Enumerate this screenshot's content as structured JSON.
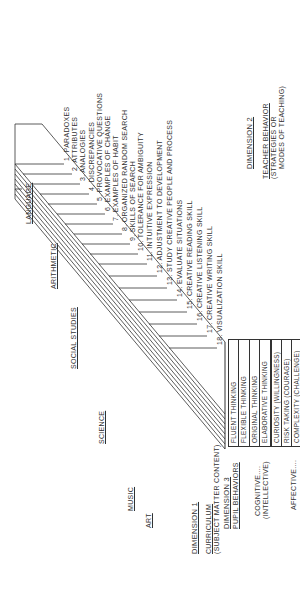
{
  "dimension1": {
    "title": "DIMENSION 1",
    "subtitle_line1": "CURRICULUM",
    "subtitle_line2": "(SUBJECT MATTER CONTENT)",
    "subjects": [
      "ART",
      "MUSIC",
      "SCIENCE",
      "SOCIAL STUDIES",
      "ARITHMETIC",
      "LANGUAGE"
    ]
  },
  "dimension2": {
    "title": "DIMENSION 2",
    "subtitle_line1": "TEACHER BEHAVIOR",
    "subtitle_line2": "(STRATEGIES OR",
    "subtitle_line3": "MODES OF TEACHING)",
    "strategies": [
      "1. PARADOXES",
      "2. ATTRIBUTES",
      "3. ANALOGIES",
      "4. DISCREPANCIES",
      "5. PROVOCATIVE QUESTIONS",
      "6. EXAMPLES OF CHANGE",
      "7. EXAMPLES OF HABIT",
      "8. ORGANIZED RANDOM SEARCH",
      "9. SKILLS OF SEARCH",
      "10. TOLERANCE FOR AMBIGUITY",
      "11. INTUITIVE EXPRESSION",
      "12. ADJUSTMENT TO DEVELOPMENT",
      "13. STUDY CREATIVE PEOPLE AND PROCESS",
      "14. EVALUATE SITUATIONS",
      "15. CREATIVE READING SKILL",
      "16. CREATIVE LISTENING SKILL",
      "17. CREATIVE WRITING SKILL",
      "18. VISUALIZATION SKILL"
    ]
  },
  "dimension3": {
    "title": "DIMENSION 3",
    "subtitle": "PUPIL BEHAVIORS",
    "cognitive_label": "COGNITIVE....",
    "cognitive_sub": "(INTELLECTIVE)",
    "affective_label": "AFFECTIVE....",
    "affective_sub": "(FEELING)",
    "cognitive_behaviors": [
      "FLUENT THINKING",
      "FLEXIBLE THINKING",
      "ORIGINAL THINKING",
      "ELABORATIVE THINKING"
    ],
    "affective_behaviors": [
      "CURIOSITY (WILLINGNESS)",
      "RISK TAKING (COURAGE)",
      "COMPLEXITY (CHALLENGE)",
      "IMAGINATION (INTUITION)"
    ]
  }
}
